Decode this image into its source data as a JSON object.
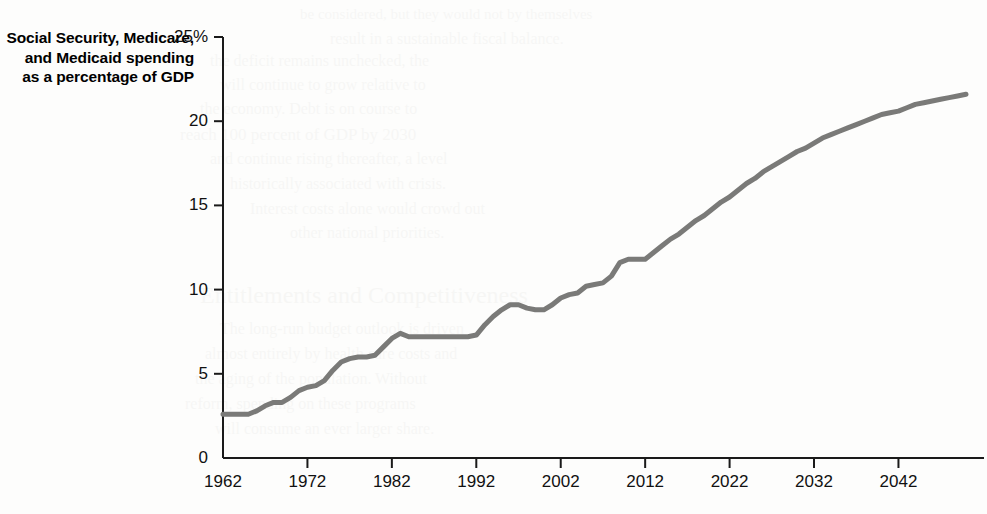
{
  "axis_title": "Social Security, Medicare, and Medicaid spending as a percentage of GDP",
  "bleed_lines": [
    {
      "x": 300,
      "y": 6,
      "size": 15,
      "text": "be considered, but they would not by themselves"
    },
    {
      "x": 330,
      "y": 30,
      "size": 16,
      "text": "result in a sustainable fiscal balance."
    },
    {
      "x": 210,
      "y": 52,
      "size": 16,
      "text": "the deficit remains unchecked, the"
    },
    {
      "x": 220,
      "y": 76,
      "size": 16,
      "text": "will continue to grow relative to"
    },
    {
      "x": 200,
      "y": 100,
      "size": 16,
      "text": "the economy. Debt is on course to"
    },
    {
      "x": 180,
      "y": 125,
      "size": 17,
      "text": "reach 100 percent of GDP by 2030"
    },
    {
      "x": 210,
      "y": 150,
      "size": 16,
      "text": "and continue rising thereafter, a level"
    },
    {
      "x": 230,
      "y": 175,
      "size": 16,
      "text": "historically associated with crisis."
    },
    {
      "x": 250,
      "y": 200,
      "size": 16,
      "text": "Interest costs alone would crowd out"
    },
    {
      "x": 290,
      "y": 224,
      "size": 16,
      "text": "other national priorities."
    },
    {
      "x": 200,
      "y": 282,
      "size": 24,
      "text": "Entitlements and Competitiveness"
    },
    {
      "x": 220,
      "y": 320,
      "size": 16,
      "text": "The long-run budget outlook is driven"
    },
    {
      "x": 205,
      "y": 345,
      "size": 16,
      "text": "almost entirely by health care costs and"
    },
    {
      "x": 195,
      "y": 370,
      "size": 16,
      "text": "the aging of the population. Without"
    },
    {
      "x": 185,
      "y": 395,
      "size": 16,
      "text": "reform, spending on these programs"
    },
    {
      "x": 215,
      "y": 420,
      "size": 16,
      "text": "will consume an ever larger share."
    }
  ],
  "chart_data": {
    "type": "line",
    "title": "",
    "subtitle": "",
    "xlabel": "",
    "ylabel": "Social Security, Medicare, and Medicaid spending as a percentage of GDP",
    "xlim": [
      1962,
      2050
    ],
    "ylim": [
      0,
      25
    ],
    "grid": false,
    "legend": "none",
    "line_color": "#7a7a78",
    "line_width": 5,
    "axis_color": "#1a1a1a",
    "y_ticks": [
      0,
      5,
      10,
      15,
      20,
      25
    ],
    "y_tick_labels": [
      "0",
      "5",
      "10",
      "15",
      "20",
      "25%"
    ],
    "x_ticks": [
      1962,
      1972,
      1982,
      1992,
      2002,
      2012,
      2022,
      2032,
      2042
    ],
    "x_tick_labels": [
      "1962",
      "1972",
      "1982",
      "1992",
      "2002",
      "2012",
      "2022",
      "2032",
      "2042"
    ],
    "series": [
      {
        "name": "Social Security, Medicare, and Medicaid spending as a percentage of GDP",
        "x": [
          1962,
          1963,
          1964,
          1965,
          1966,
          1967,
          1968,
          1969,
          1970,
          1971,
          1972,
          1973,
          1974,
          1975,
          1976,
          1977,
          1978,
          1979,
          1980,
          1981,
          1982,
          1983,
          1984,
          1985,
          1986,
          1987,
          1988,
          1989,
          1990,
          1991,
          1992,
          1993,
          1994,
          1995,
          1996,
          1997,
          1998,
          1999,
          2000,
          2001,
          2002,
          2003,
          2004,
          2005,
          2006,
          2007,
          2008,
          2009,
          2010,
          2011,
          2012,
          2013,
          2014,
          2015,
          2016,
          2017,
          2018,
          2019,
          2020,
          2021,
          2022,
          2023,
          2024,
          2025,
          2026,
          2027,
          2028,
          2029,
          2030,
          2031,
          2032,
          2033,
          2034,
          2035,
          2036,
          2037,
          2038,
          2039,
          2040,
          2041,
          2042,
          2043,
          2044,
          2045,
          2046,
          2047,
          2048,
          2049,
          2050
        ],
        "y": [
          2.6,
          2.6,
          2.6,
          2.6,
          2.8,
          3.1,
          3.3,
          3.3,
          3.6,
          4.0,
          4.2,
          4.3,
          4.6,
          5.2,
          5.7,
          5.9,
          6.0,
          6.0,
          6.1,
          6.6,
          7.1,
          7.4,
          7.2,
          7.2,
          7.2,
          7.2,
          7.2,
          7.2,
          7.2,
          7.2,
          7.3,
          7.9,
          8.4,
          8.8,
          9.1,
          9.1,
          8.9,
          8.8,
          8.8,
          9.1,
          9.5,
          9.7,
          9.8,
          10.2,
          10.3,
          10.4,
          10.8,
          11.6,
          11.8,
          11.8,
          11.8,
          12.2,
          12.6,
          13.0,
          13.3,
          13.7,
          14.1,
          14.4,
          14.8,
          15.2,
          15.5,
          15.9,
          16.3,
          16.6,
          17.0,
          17.3,
          17.6,
          17.9,
          18.2,
          18.4,
          18.7,
          19.0,
          19.2,
          19.4,
          19.6,
          19.8,
          20.0,
          20.2,
          20.4,
          20.5,
          20.6,
          20.8,
          21.0,
          21.1,
          21.2,
          21.3,
          21.4,
          21.5,
          21.6
        ]
      }
    ]
  }
}
